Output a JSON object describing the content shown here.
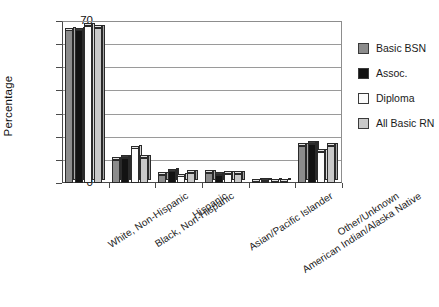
{
  "chart_data": {
    "type": "bar",
    "title": "",
    "xlabel": "",
    "ylabel": "Percentage",
    "ylim": [
      0,
      70
    ],
    "yticks": [
      0,
      10,
      20,
      30,
      40,
      50,
      60,
      70
    ],
    "grid": true,
    "legend_position": "right",
    "categories": [
      "White, Non-Hispanic",
      "Black, Non-Hispanic",
      "Hispanic",
      "Asian/Pacific Islander",
      "American Indian/Alaska Native",
      "Other/Unknown"
    ],
    "series": [
      {
        "name": "Basic BSN",
        "color": "#8c8c8c",
        "values": [
          66.0,
          10.0,
          3.5,
          4.5,
          0.7,
          16.0
        ]
      },
      {
        "name": "Assoc.",
        "color": "#121212",
        "values": [
          66.0,
          11.0,
          5.0,
          3.5,
          1.0,
          17.0
        ]
      },
      {
        "name": "Diploma",
        "color": "#fbfbfb",
        "values": [
          68.0,
          15.0,
          3.0,
          4.0,
          0.6,
          13.5
        ]
      },
      {
        "name": "All Basic RN",
        "color": "#c9c9c9",
        "values": [
          67.0,
          11.0,
          4.5,
          4.0,
          0.8,
          16.0
        ]
      }
    ]
  },
  "axis": {
    "y_title": "Percentage"
  },
  "legend": {
    "items": [
      {
        "label": "Basic BSN"
      },
      {
        "label": "Assoc."
      },
      {
        "label": "Diploma"
      },
      {
        "label": "All Basic RN"
      }
    ]
  }
}
